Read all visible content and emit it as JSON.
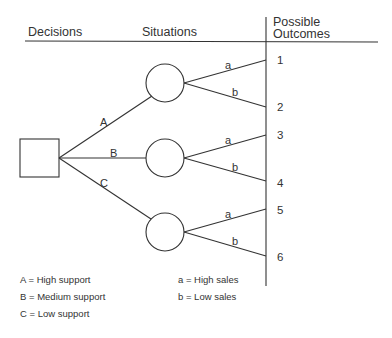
{
  "headers": {
    "decisions": "Decisions",
    "situations": "Situations",
    "outcomes_line1": "Possible",
    "outcomes_line2": "Outcomes"
  },
  "decision_branches": [
    {
      "label": "A"
    },
    {
      "label": "B"
    },
    {
      "label": "C"
    }
  ],
  "situation_branches": [
    {
      "label": "a"
    },
    {
      "label": "b"
    }
  ],
  "outcomes": [
    "1",
    "2",
    "3",
    "4",
    "5",
    "6"
  ],
  "legend": {
    "decisions": [
      "A = High support",
      "B = Medium support",
      "C = Low support"
    ],
    "situations": [
      "a = High sales",
      "b = Low sales"
    ]
  }
}
